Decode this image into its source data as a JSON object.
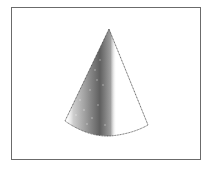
{
  "figure": {
    "frame_color": "#6b6b6b",
    "ink_color": "#2a2a2a",
    "background": "#ffffff",
    "cone": {
      "apex": [
        109,
        29
      ],
      "base_left": [
        65,
        121
      ],
      "base_bottom": [
        110,
        136
      ],
      "base_right": [
        148,
        125
      ]
    }
  }
}
